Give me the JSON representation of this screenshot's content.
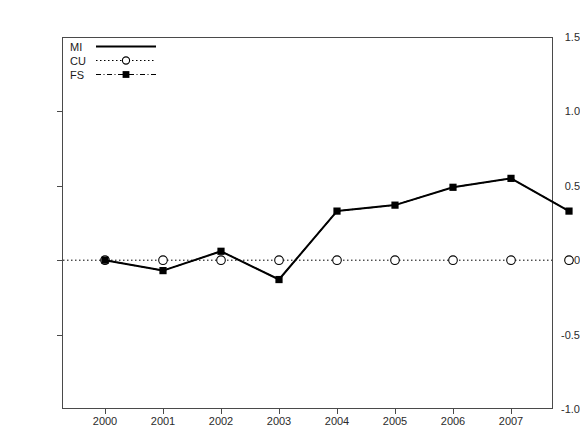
{
  "chart_data": {
    "type": "line",
    "title": "",
    "xlabel": "",
    "ylabel": "",
    "categories": [
      "2000",
      "2001",
      "2002",
      "2003",
      "2004",
      "2005",
      "2006",
      "2007",
      "2008"
    ],
    "x": [
      2000,
      2001,
      2002,
      2003,
      2004,
      2005,
      2006,
      2007,
      2008
    ],
    "xlim": [
      1999.6,
      2008.8
    ],
    "ylim": [
      -1.0,
      1.5
    ],
    "yticks": [
      1.5,
      1.0,
      0.5,
      0.0,
      -0.5,
      -1.0
    ],
    "ytick_labels": [
      "1.5",
      "1.0",
      "0.5",
      "0.0",
      "-0.5",
      "-1.0"
    ],
    "grid": false,
    "legend_position": "top-left",
    "series": [
      {
        "name": "MI",
        "style": "solid",
        "marker": "none",
        "color": "#000000",
        "values": [
          0.0,
          -0.07,
          0.06,
          -0.13,
          0.33,
          0.37,
          0.49,
          0.55,
          0.33
        ]
      },
      {
        "name": "CU",
        "style": "dotted",
        "marker": "open-circle",
        "color": "#000000",
        "values": [
          0.0,
          0.0,
          0.0,
          0.0,
          0.0,
          0.0,
          0.0,
          0.0,
          0.0
        ]
      },
      {
        "name": "FS",
        "style": "dash-dot",
        "marker": "filled-square",
        "color": "#000000",
        "values": [
          0.0,
          -0.07,
          0.06,
          -0.13,
          0.33,
          0.37,
          0.49,
          0.55,
          0.33
        ]
      }
    ]
  }
}
